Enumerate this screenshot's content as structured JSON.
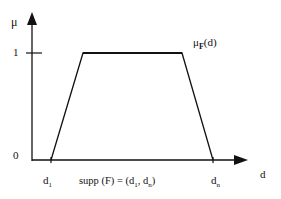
{
  "diagram": {
    "type": "trapezoidal-membership-function",
    "y_axis": {
      "label": "μ",
      "ticks": [
        {
          "value": 0,
          "label": "0"
        },
        {
          "value": 1,
          "label": "1"
        }
      ]
    },
    "x_axis": {
      "label": "d"
    },
    "curve_label": {
      "base": "μ",
      "sub": "F",
      "tail": "(d)"
    },
    "points": [
      {
        "label_base": "d",
        "label_sub": "1"
      },
      {
        "label_base": "d",
        "label_sub": "n"
      }
    ],
    "support": {
      "prefix": "supp (F) = (d",
      "sub1": "1",
      "mid": ", d",
      "sub2": "n",
      "suffix": ")"
    },
    "colors": {
      "line": "#111111",
      "background": "#ffffff"
    }
  }
}
